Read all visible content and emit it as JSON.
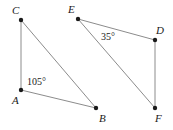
{
  "figure": {
    "background_color": "#ffffff",
    "stroke_color": "#8c8c8c",
    "vertex_color": "#1a1a1a",
    "text_color": "#1a1a1a",
    "stroke_width": 1,
    "vertex_radius": 2.2,
    "width": 173,
    "height": 130
  },
  "shapes": [
    {
      "name": "triangle-abc",
      "vertices": [
        "A",
        "B",
        "C"
      ],
      "path": "M 21 20 L 21 90 L 96 108 Z"
    },
    {
      "name": "triangle-def",
      "vertices": [
        "E",
        "D",
        "F"
      ],
      "path": "M 78 19 L 155 40 L 155 108 Z"
    }
  ],
  "vertices": [
    {
      "id": "C",
      "label": "C",
      "cx": 21,
      "cy": 20,
      "label_x": 12,
      "label_y": 5
    },
    {
      "id": "A",
      "label": "A",
      "cx": 21,
      "cy": 90,
      "label_x": 12,
      "label_y": 95
    },
    {
      "id": "B",
      "label": "B",
      "cx": 96,
      "cy": 108,
      "label_x": 99,
      "label_y": 113
    },
    {
      "id": "E",
      "label": "E",
      "cx": 78,
      "cy": 19,
      "label_x": 68,
      "label_y": 4
    },
    {
      "id": "D",
      "label": "D",
      "cx": 155,
      "cy": 40,
      "label_x": 156,
      "label_y": 25
    },
    {
      "id": "F",
      "label": "F",
      "cx": 155,
      "cy": 108,
      "label_x": 155,
      "label_y": 113
    }
  ],
  "angles": [
    {
      "id": "angle-a",
      "label": "105°",
      "at_vertex": "A",
      "x": 27,
      "y": 77
    },
    {
      "id": "angle-e",
      "label": "35°",
      "at_vertex": "E",
      "x": 101,
      "y": 32
    }
  ]
}
